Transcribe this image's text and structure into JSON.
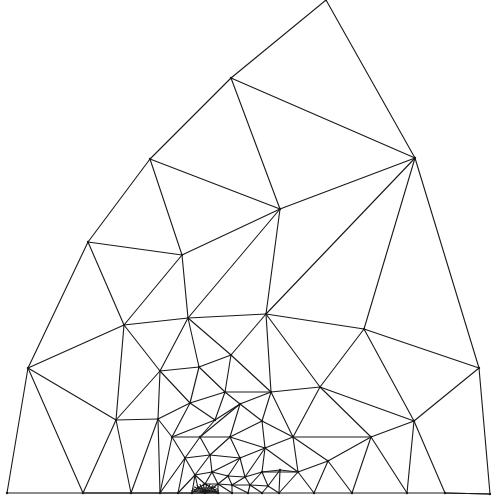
{
  "diagram": {
    "type": "triangular-finite-element-mesh",
    "stroke_color": "#1a1a1a",
    "background": "#ffffff",
    "refinement_center": [
      205,
      491
    ],
    "nodes": [
      [
        326,
        0
      ],
      [
        231,
        78
      ],
      [
        150,
        159
      ],
      [
        88,
        242
      ],
      [
        28,
        368
      ],
      [
        7,
        493
      ],
      [
        415,
        158
      ],
      [
        479,
        368
      ],
      [
        490,
        494
      ],
      [
        280,
        209
      ],
      [
        182,
        255
      ],
      [
        124,
        325
      ],
      [
        188,
        318
      ],
      [
        266,
        314
      ],
      [
        364,
        329
      ],
      [
        116,
        420
      ],
      [
        160,
        371
      ],
      [
        199,
        367
      ],
      [
        231,
        355
      ],
      [
        158,
        419
      ],
      [
        190,
        403
      ],
      [
        225,
        392
      ],
      [
        271,
        392
      ],
      [
        320,
        387
      ],
      [
        414,
        421
      ],
      [
        371,
        437
      ],
      [
        293,
        437
      ],
      [
        240,
        404
      ],
      [
        215,
        420
      ],
      [
        262,
        421
      ],
      [
        172,
        437
      ],
      [
        200,
        437
      ],
      [
        230,
        437
      ],
      [
        328,
        461
      ],
      [
        298,
        472
      ],
      [
        265,
        448
      ],
      [
        185,
        458
      ],
      [
        210,
        455
      ],
      [
        240,
        458
      ],
      [
        83,
        493
      ],
      [
        131,
        493
      ],
      [
        160,
        493
      ],
      [
        178,
        493
      ],
      [
        192,
        493
      ],
      [
        218,
        493
      ],
      [
        232,
        493
      ],
      [
        248,
        493
      ],
      [
        262,
        493
      ],
      [
        279,
        493
      ],
      [
        314,
        493
      ],
      [
        352,
        493
      ],
      [
        407,
        493
      ],
      [
        445,
        493
      ],
      [
        195,
        475
      ],
      [
        212,
        472
      ],
      [
        228,
        476
      ],
      [
        245,
        477
      ],
      [
        262,
        472
      ],
      [
        280,
        470
      ],
      [
        205,
        484
      ],
      [
        218,
        484
      ],
      [
        232,
        485
      ],
      [
        250,
        485
      ],
      [
        268,
        486
      ],
      [
        198,
        488
      ],
      [
        212,
        488
      ]
    ],
    "edges": [
      [
        0,
        1
      ],
      [
        1,
        2
      ],
      [
        2,
        3
      ],
      [
        3,
        4
      ],
      [
        4,
        5
      ],
      [
        5,
        39
      ],
      [
        0,
        6
      ],
      [
        6,
        7
      ],
      [
        7,
        8
      ],
      [
        8,
        52
      ],
      [
        1,
        6
      ],
      [
        1,
        9
      ],
      [
        6,
        9
      ],
      [
        2,
        9
      ],
      [
        2,
        10
      ],
      [
        9,
        10
      ],
      [
        3,
        10
      ],
      [
        3,
        11
      ],
      [
        10,
        11
      ],
      [
        10,
        12
      ],
      [
        9,
        12
      ],
      [
        9,
        13
      ],
      [
        6,
        13
      ],
      [
        6,
        14
      ],
      [
        13,
        14
      ],
      [
        11,
        12
      ],
      [
        12,
        13
      ],
      [
        4,
        11
      ],
      [
        4,
        15
      ],
      [
        11,
        15
      ],
      [
        11,
        16
      ],
      [
        12,
        16
      ],
      [
        12,
        17
      ],
      [
        16,
        17
      ],
      [
        12,
        18
      ],
      [
        17,
        18
      ],
      [
        13,
        18
      ],
      [
        18,
        21
      ],
      [
        17,
        21
      ],
      [
        13,
        22
      ],
      [
        18,
        22
      ],
      [
        21,
        22
      ],
      [
        13,
        23
      ],
      [
        14,
        23
      ],
      [
        14,
        7
      ],
      [
        14,
        24
      ],
      [
        7,
        24
      ],
      [
        23,
        24
      ],
      [
        22,
        23
      ],
      [
        15,
        16
      ],
      [
        15,
        19
      ],
      [
        16,
        19
      ],
      [
        16,
        20
      ],
      [
        19,
        20
      ],
      [
        17,
        20
      ],
      [
        20,
        21
      ],
      [
        21,
        27
      ],
      [
        22,
        27
      ],
      [
        22,
        29
      ],
      [
        27,
        29
      ],
      [
        23,
        26
      ],
      [
        22,
        26
      ],
      [
        29,
        26
      ],
      [
        23,
        25
      ],
      [
        24,
        25
      ],
      [
        25,
        26
      ],
      [
        20,
        28
      ],
      [
        21,
        28
      ],
      [
        27,
        28
      ],
      [
        19,
        30
      ],
      [
        20,
        30
      ],
      [
        28,
        30
      ],
      [
        28,
        31
      ],
      [
        30,
        31
      ],
      [
        27,
        31
      ],
      [
        27,
        32
      ],
      [
        31,
        32
      ],
      [
        29,
        32
      ],
      [
        29,
        35
      ],
      [
        26,
        35
      ],
      [
        32,
        35
      ],
      [
        25,
        33
      ],
      [
        26,
        33
      ],
      [
        33,
        34
      ],
      [
        26,
        34
      ],
      [
        35,
        34
      ],
      [
        4,
        39
      ],
      [
        15,
        39
      ],
      [
        15,
        40
      ],
      [
        39,
        40
      ],
      [
        19,
        40
      ],
      [
        19,
        41
      ],
      [
        40,
        41
      ],
      [
        30,
        41
      ],
      [
        30,
        36
      ],
      [
        41,
        36
      ],
      [
        31,
        36
      ],
      [
        31,
        37
      ],
      [
        36,
        37
      ],
      [
        32,
        37
      ],
      [
        32,
        38
      ],
      [
        37,
        38
      ],
      [
        35,
        38
      ],
      [
        41,
        42
      ],
      [
        36,
        42
      ],
      [
        42,
        43
      ],
      [
        36,
        53
      ],
      [
        37,
        53
      ],
      [
        37,
        54
      ],
      [
        53,
        54
      ],
      [
        38,
        54
      ],
      [
        38,
        55
      ],
      [
        54,
        55
      ],
      [
        38,
        56
      ],
      [
        55,
        56
      ],
      [
        35,
        56
      ],
      [
        35,
        57
      ],
      [
        56,
        57
      ],
      [
        34,
        57
      ],
      [
        34,
        58
      ],
      [
        57,
        58
      ],
      [
        34,
        48
      ],
      [
        58,
        48
      ],
      [
        33,
        49
      ],
      [
        34,
        49
      ],
      [
        33,
        50
      ],
      [
        25,
        50
      ],
      [
        25,
        51
      ],
      [
        24,
        51
      ],
      [
        24,
        52
      ],
      [
        51,
        52
      ],
      [
        52,
        8
      ],
      [
        53,
        59
      ],
      [
        54,
        59
      ],
      [
        54,
        60
      ],
      [
        59,
        60
      ],
      [
        55,
        60
      ],
      [
        55,
        61
      ],
      [
        60,
        61
      ],
      [
        56,
        61
      ],
      [
        56,
        62
      ],
      [
        61,
        62
      ],
      [
        57,
        62
      ],
      [
        57,
        63
      ],
      [
        62,
        63
      ],
      [
        58,
        63
      ],
      [
        63,
        48
      ],
      [
        43,
        64
      ],
      [
        53,
        64
      ],
      [
        59,
        64
      ],
      [
        59,
        65
      ],
      [
        64,
        65
      ],
      [
        60,
        65
      ],
      [
        64,
        44
      ],
      [
        65,
        44
      ],
      [
        60,
        44
      ],
      [
        60,
        45
      ],
      [
        61,
        45
      ],
      [
        61,
        46
      ],
      [
        62,
        46
      ],
      [
        62,
        47
      ],
      [
        63,
        47
      ],
      [
        47,
        48
      ],
      [
        48,
        49
      ],
      [
        49,
        50
      ],
      [
        50,
        51
      ],
      [
        42,
        53
      ],
      [
        43,
        53
      ],
      [
        39,
        40
      ],
      [
        40,
        41
      ],
      [
        41,
        42
      ],
      [
        42,
        43
      ],
      [
        43,
        44
      ],
      [
        44,
        45
      ],
      [
        45,
        46
      ],
      [
        46,
        47
      ]
    ]
  }
}
